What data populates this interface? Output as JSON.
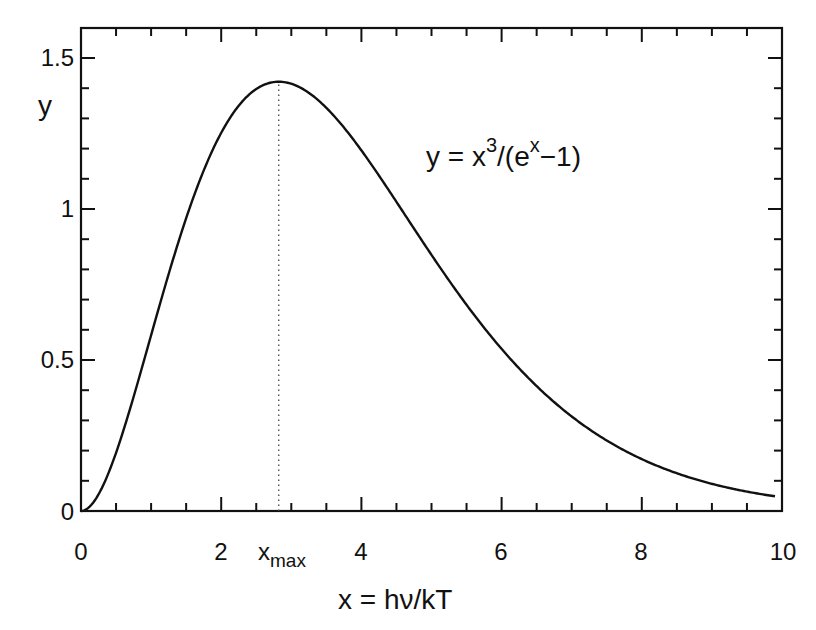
{
  "chart_data": {
    "type": "line",
    "title": "",
    "function": "y = x^3/(e^x - 1)",
    "xlabel": "x = hν/kT",
    "ylabel": "y",
    "xlim": [
      0,
      10
    ],
    "ylim": [
      0,
      1.6
    ],
    "grid": false,
    "legend": null,
    "x_ticks": [
      0,
      2,
      4,
      6,
      8,
      10
    ],
    "x_tick_labels": [
      "0",
      "2",
      "4",
      "6",
      "8",
      "10"
    ],
    "y_ticks": [
      0,
      0.5,
      1,
      1.5
    ],
    "y_tick_labels": [
      "0",
      "0.5",
      "1",
      "1.5"
    ],
    "x_minor_tick_step": 0.5,
    "y_minor_tick_step": 0.1,
    "annotations": [
      {
        "text": "y = x³/(eˣ−1)",
        "position": "upper right"
      },
      {
        "text": "x_max",
        "x": 2.821,
        "style": "dotted vertical line from axis to peak"
      }
    ],
    "peak": {
      "x": 2.821,
      "y": 1.421
    },
    "series": [
      {
        "name": "y = x^3/(e^x-1)",
        "x": [
          0,
          0.5,
          1,
          1.5,
          2,
          2.5,
          2.821,
          3,
          3.5,
          4,
          4.5,
          5,
          5.5,
          6,
          6.5,
          7,
          7.5,
          8,
          8.5,
          9,
          9.5,
          9.9
        ],
        "values": [
          0,
          0.193,
          0.582,
          0.973,
          1.252,
          1.394,
          1.421,
          1.417,
          1.35,
          1.194,
          1.011,
          0.852,
          0.695,
          0.541,
          0.415,
          0.313,
          0.233,
          0.172,
          0.125,
          0.09,
          0.064,
          0.049
        ]
      }
    ]
  },
  "labels": {
    "ylabel": "y",
    "xlabel": "x  =  hν/kT",
    "formula_y": "y  =  x",
    "formula_exp3": "3",
    "formula_mid": "/(e",
    "formula_expx": "x",
    "formula_end": "−1)",
    "xmax_base": "x",
    "xmax_sub": "max",
    "xticks": [
      "0",
      "2",
      "4",
      "6",
      "8",
      "10"
    ],
    "yticks": [
      "0",
      "0.5",
      "1",
      "1.5"
    ]
  },
  "colors": {
    "line": "#111111",
    "axis": "#111111",
    "background": "#ffffff"
  }
}
